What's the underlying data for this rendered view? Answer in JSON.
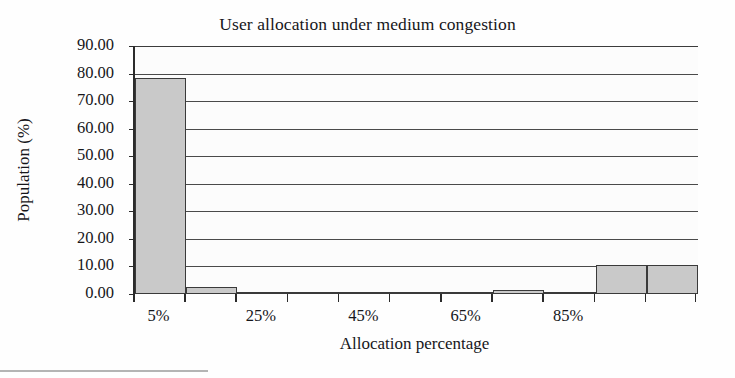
{
  "figure": {
    "title": "User allocation under medium congestion",
    "x_axis_title": "Allocation percentage",
    "y_axis_title": "Population (%)"
  },
  "axes": {
    "y_tick_labels": [
      "90.00",
      "80.00",
      "70.00",
      "60.00",
      "50.00",
      "40.00",
      "30.00",
      "20.00",
      "10.00",
      "0.00"
    ],
    "x_tick_labels": [
      "5%",
      "25%",
      "45%",
      "65%",
      "85%"
    ]
  },
  "colors": {
    "bar_fill": "#c9c9c9",
    "bar_outline": "#3a3a3a",
    "gridline": "#4a4a4a",
    "axis": "#2b2b2b",
    "text": "#16161a",
    "background": "#ffffff"
  },
  "chart_data": {
    "type": "bar",
    "title": "User allocation under medium congestion",
    "xlabel": "Allocation percentage",
    "ylabel": "Population (%)",
    "ylim": [
      0,
      90
    ],
    "ytick_values": [
      0,
      10,
      20,
      30,
      40,
      50,
      60,
      70,
      80,
      90
    ],
    "ytick_labels": [
      "0.00",
      "10.00",
      "20.00",
      "30.00",
      "40.00",
      "50.00",
      "60.00",
      "70.00",
      "80.00",
      "90.00"
    ],
    "grid": true,
    "legend": false,
    "categories": [
      "5%",
      "15%",
      "25%",
      "35%",
      "45%",
      "55%",
      "65%",
      "75%",
      "85%",
      "95%",
      "105%"
    ],
    "labeled_categories": [
      "5%",
      "25%",
      "45%",
      "65%",
      "85%"
    ],
    "values": [
      78.5,
      2.6,
      0.3,
      0.2,
      0.2,
      0.6,
      0.6,
      1.4,
      0.1,
      10.5,
      10.5
    ],
    "bars": [
      {
        "category": "5%",
        "value": 78.5,
        "bin_index": 0
      },
      {
        "category": "15%",
        "value": 2.6,
        "bin_index": 1
      },
      {
        "category": "25%",
        "value": 0.3,
        "bin_index": 2
      },
      {
        "category": "35%",
        "value": 0.2,
        "bin_index": 3
      },
      {
        "category": "45%",
        "value": 0.2,
        "bin_index": 4
      },
      {
        "category": "55%",
        "value": 0.6,
        "bin_index": 5
      },
      {
        "category": "65%",
        "value": 0.6,
        "bin_index": 6
      },
      {
        "category": "75%",
        "value": 1.4,
        "bin_index": 7
      },
      {
        "category": "85%",
        "value": 0.1,
        "bin_index": 8
      },
      {
        "category": "95%",
        "value": 10.5,
        "bin_index": 9
      },
      {
        "category": "105%",
        "value": 10.5,
        "bin_index": 10
      }
    ]
  }
}
